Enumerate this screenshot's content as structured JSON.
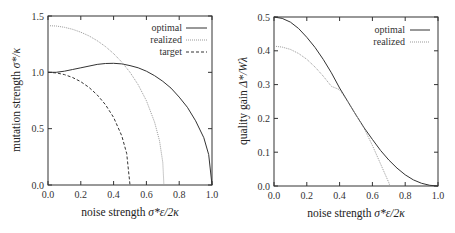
{
  "chart_data": [
    {
      "type": "line",
      "title": "",
      "xlabel": "noise strength σ*ε/2κ",
      "ylabel": "mutation strength σ*/κ",
      "xlim": [
        0,
        1.0
      ],
      "ylim": [
        0,
        1.5
      ],
      "xticks": [
        "0.0",
        "0.2",
        "0.4",
        "0.6",
        "0.8",
        "1.0"
      ],
      "yticks": [
        "0.0",
        "0.5",
        "1.0",
        "1.5"
      ],
      "grid": false,
      "legend_position": "top-right",
      "series": [
        {
          "name": "optimal",
          "style": "solid",
          "color": "#333333",
          "x": [
            0,
            0.05,
            0.1,
            0.15,
            0.2,
            0.25,
            0.3,
            0.35,
            0.4,
            0.45,
            0.5,
            0.55,
            0.6,
            0.65,
            0.7,
            0.75,
            0.8,
            0.85,
            0.9,
            0.95,
            0.98,
            1.0
          ],
          "y": [
            1.0,
            1.0,
            1.01,
            1.025,
            1.04,
            1.055,
            1.07,
            1.078,
            1.08,
            1.075,
            1.06,
            1.04,
            1.01,
            0.97,
            0.92,
            0.86,
            0.78,
            0.69,
            0.57,
            0.42,
            0.27,
            0.0
          ]
        },
        {
          "name": "realized",
          "style": "dotted",
          "color": "#888888",
          "x": [
            0,
            0.05,
            0.1,
            0.15,
            0.2,
            0.25,
            0.3,
            0.35,
            0.4,
            0.45,
            0.5,
            0.55,
            0.6,
            0.65,
            0.68,
            0.7,
            0.707
          ],
          "y": [
            1.414,
            1.411,
            1.4,
            1.382,
            1.356,
            1.323,
            1.281,
            1.229,
            1.166,
            1.091,
            1.0,
            0.889,
            0.748,
            0.557,
            0.393,
            0.2,
            0.0
          ]
        },
        {
          "name": "target",
          "style": "dashed",
          "color": "#333333",
          "x": [
            0,
            0.05,
            0.1,
            0.15,
            0.2,
            0.25,
            0.3,
            0.35,
            0.4,
            0.45,
            0.48,
            0.5
          ],
          "y": [
            1.0,
            0.995,
            0.98,
            0.954,
            0.917,
            0.866,
            0.8,
            0.714,
            0.6,
            0.436,
            0.28,
            0.0
          ]
        }
      ]
    },
    {
      "type": "line",
      "title": "",
      "xlabel": "noise strength σ*ε/2κ",
      "ylabel": "quality gain Δ*/W_λ",
      "xlim": [
        0,
        1.0
      ],
      "ylim": [
        0,
        0.5
      ],
      "xticks": [
        "0.0",
        "0.2",
        "0.4",
        "0.6",
        "0.8",
        "1.0"
      ],
      "yticks": [
        "0.0",
        "0.1",
        "0.2",
        "0.3",
        "0.4",
        "0.5"
      ],
      "grid": false,
      "legend_position": "top-right",
      "series": [
        {
          "name": "optimal",
          "style": "solid",
          "color": "#333333",
          "x": [
            0,
            0.05,
            0.1,
            0.15,
            0.2,
            0.25,
            0.3,
            0.35,
            0.4,
            0.45,
            0.5,
            0.55,
            0.6,
            0.65,
            0.7,
            0.75,
            0.8,
            0.85,
            0.9,
            0.95,
            1.0
          ],
          "y": [
            0.5,
            0.496,
            0.485,
            0.466,
            0.44,
            0.41,
            0.375,
            0.335,
            0.29,
            0.25,
            0.21,
            0.172,
            0.138,
            0.105,
            0.077,
            0.053,
            0.033,
            0.018,
            0.008,
            0.002,
            0.0
          ]
        },
        {
          "name": "realized",
          "style": "dotted",
          "color": "#888888",
          "x": [
            0,
            0.05,
            0.1,
            0.15,
            0.2,
            0.25,
            0.3,
            0.35,
            0.4,
            0.45,
            0.5,
            0.55,
            0.6,
            0.65,
            0.7,
            0.707
          ],
          "y": [
            0.414,
            0.411,
            0.404,
            0.392,
            0.375,
            0.352,
            0.325,
            0.295,
            0.285,
            0.25,
            0.21,
            0.17,
            0.12,
            0.065,
            0.01,
            0.0
          ]
        }
      ]
    }
  ],
  "plots": [
    {
      "ylabel_main": "mutation strength ",
      "ylabel_sym": "σ*/κ",
      "xlabel_main": "noise strength ",
      "xlabel_sym": "σ*ε/2κ",
      "legend": [
        "optimal",
        "realized",
        "target"
      ]
    },
    {
      "ylabel_main": "quality gain ",
      "ylabel_sym": "Δ*/Wλ",
      "xlabel_main": "noise strength ",
      "xlabel_sym": "σ*ε/2κ",
      "legend": [
        "optimal",
        "realized"
      ]
    }
  ]
}
